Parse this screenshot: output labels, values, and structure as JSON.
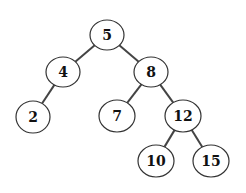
{
  "diagram": {
    "type": "binary-search-tree",
    "colors": {
      "background": "#ffffff",
      "node_fill": "#ffffff",
      "node_stroke": "#333333",
      "edge": "#444444",
      "text": "#111111"
    },
    "nodes": [
      {
        "id": "n5",
        "label": "5",
        "cx": 107,
        "cy": 35,
        "rx": 17,
        "ry": 15
      },
      {
        "id": "n4",
        "label": "4",
        "cx": 63,
        "cy": 72,
        "rx": 17,
        "ry": 15
      },
      {
        "id": "n8",
        "label": "8",
        "cx": 151,
        "cy": 72,
        "rx": 17,
        "ry": 15
      },
      {
        "id": "n2",
        "label": "2",
        "cx": 33,
        "cy": 117,
        "rx": 17,
        "ry": 16
      },
      {
        "id": "n7",
        "label": "7",
        "cx": 117,
        "cy": 116,
        "rx": 18,
        "ry": 16
      },
      {
        "id": "n12",
        "label": "12",
        "cx": 183,
        "cy": 116,
        "rx": 18,
        "ry": 16
      },
      {
        "id": "n10",
        "label": "10",
        "cx": 156,
        "cy": 161,
        "rx": 18,
        "ry": 16
      },
      {
        "id": "n15",
        "label": "15",
        "cx": 211,
        "cy": 161,
        "rx": 18,
        "ry": 16
      }
    ],
    "edges": [
      {
        "from": "n5",
        "to": "n4"
      },
      {
        "from": "n5",
        "to": "n8"
      },
      {
        "from": "n4",
        "to": "n2"
      },
      {
        "from": "n8",
        "to": "n7"
      },
      {
        "from": "n8",
        "to": "n12"
      },
      {
        "from": "n12",
        "to": "n10"
      },
      {
        "from": "n12",
        "to": "n15"
      }
    ]
  }
}
